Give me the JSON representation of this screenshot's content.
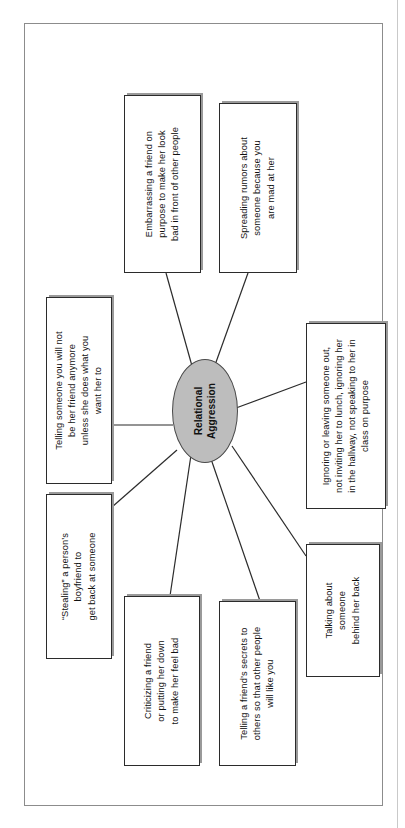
{
  "document": {
    "type": "concept-map-worksheet",
    "orientation": "rotated-90-counterclockwise"
  },
  "diagram": {
    "center": {
      "label": "Relational\nAggression",
      "shape": "ellipse",
      "fill_color": "#bdbdbd",
      "border_color": "#4a4a4a"
    },
    "nodes": [
      {
        "id": "stealing",
        "label": "“Stealing” a person’s\nboyfriend to\nget back at someone"
      },
      {
        "id": "threat",
        "label": "Telling someone you will not\nbe her friend anymore\nunless she does what you\nwant her to"
      },
      {
        "id": "criticizing",
        "label": "Criticizing a friend\nor putting her down\nto make her feel bad"
      },
      {
        "id": "secrets",
        "label": "Telling a friend’s secrets to\nothers so that other people\nwill like you"
      },
      {
        "id": "talking",
        "label": "Talking about\nsomeone\nbehind her back"
      },
      {
        "id": "ignoring",
        "label": "Ignoring or leaving someone out,\nnot inviting her to lunch, ignoring her\nin the hallway, not speaking to her in\nclass on purpose"
      },
      {
        "id": "rumors",
        "label": "Spreading rumors about\nsomeone because you\nare mad at her"
      },
      {
        "id": "embarrassing",
        "label": "Embarrassing a friend on\npurpose to make her look\nbad in front of other people"
      }
    ],
    "connector_count": 8,
    "box_border_color": "#2b2b2b",
    "box_fill_color": "#ffffff",
    "page_border_color": "#8c8c8c"
  }
}
